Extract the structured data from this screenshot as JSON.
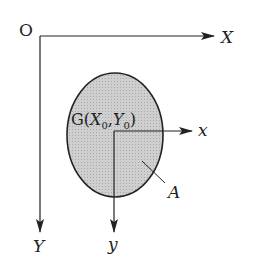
{
  "diagram": {
    "global_axes": {
      "origin_label": "O",
      "x_label": "X",
      "y_label": "Y"
    },
    "centroid": {
      "label_prefix": "G(",
      "x_sym": "X",
      "x_sub": "0",
      "comma": ",",
      "y_sym": "Y",
      "y_sub": "0",
      "label_suffix": ")"
    },
    "local_axes": {
      "x_label": "x",
      "y_label": "y"
    },
    "area_label": "A",
    "colors": {
      "line": "#222222",
      "area_fill": "#c8c8c8",
      "background": "#ffffff"
    }
  }
}
